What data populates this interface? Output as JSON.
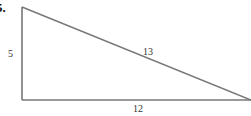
{
  "problem": {
    "number_label": "5."
  },
  "triangle": {
    "type": "right-triangle",
    "vertices": {
      "top_left": [
        22,
        7
      ],
      "bottom_left": [
        22,
        100
      ],
      "bottom_right": [
        251,
        100
      ]
    },
    "stroke_color": "#777777",
    "sides": {
      "left": "5",
      "hypotenuse": "13",
      "bottom": "12"
    }
  }
}
